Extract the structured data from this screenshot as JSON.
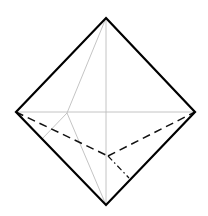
{
  "diagram": {
    "title": "",
    "colors": {
      "background": "#ffffff",
      "outline": "#000000",
      "construction": "#bdbdbd",
      "hidden": "#111111"
    },
    "vertices": {
      "top": [
        106,
        18
      ],
      "left": [
        16,
        112
      ],
      "right": [
        195,
        112
      ],
      "bottom": [
        106,
        205
      ],
      "inner_peak": [
        67,
        113
      ],
      "hidden_point": [
        108,
        156
      ],
      "edge_foot": [
        129,
        178
      ],
      "left_foot": [
        42,
        139
      ]
    },
    "outline_edges": [
      {
        "from": "top",
        "to": "right"
      },
      {
        "from": "right",
        "to": "bottom"
      },
      {
        "from": "bottom",
        "to": "left"
      },
      {
        "from": "left",
        "to": "top"
      }
    ],
    "construction_lines": [
      {
        "from": "left",
        "to": "right"
      },
      {
        "from": "top",
        "to": "bottom"
      },
      {
        "from": "top",
        "to": "inner_peak"
      },
      {
        "from": "inner_peak",
        "to": "bottom"
      },
      {
        "from": "inner_peak",
        "to": "left_foot"
      }
    ],
    "dashed_lines": [
      {
        "from": "left",
        "to": "hidden_point"
      },
      {
        "from": "hidden_point",
        "to": "right"
      }
    ],
    "dash_dot_lines": [
      {
        "from": "hidden_point",
        "to": "edge_foot"
      }
    ]
  }
}
